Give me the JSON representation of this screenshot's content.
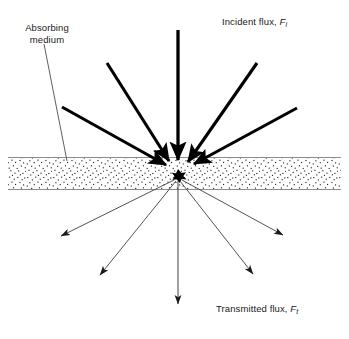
{
  "figure": {
    "background_color": "#ffffff",
    "line_color": "#000000",
    "slab_border_color": "#808080",
    "stipple_color": "#2b2b2b",
    "ray_thin_color": "#555555"
  },
  "labels": {
    "absorbing_medium": "Absorbing\nmedium",
    "incident_flux_text": "Incident flux, ",
    "incident_flux_symbol": "F",
    "incident_flux_subscript": "i",
    "transmitted_flux_text": "Transmitted flux, ",
    "transmitted_flux_symbol": "F",
    "transmitted_flux_subscript": "t"
  },
  "diagram_data": {
    "type": "physics-schematic",
    "scatter_point": {
      "x": 178,
      "y": 176
    },
    "slab": {
      "x": 8,
      "y": 157,
      "width": 333,
      "height": 33
    },
    "incident_rays": [
      {
        "name": "incident-ray-far-left",
        "x1": 62,
        "y1": 107,
        "x2": 170,
        "y2": 167,
        "weight": "thick"
      },
      {
        "name": "incident-ray-left",
        "x1": 107,
        "y1": 63,
        "x2": 172,
        "y2": 163,
        "weight": "thick"
      },
      {
        "name": "incident-ray-vertical",
        "x1": 178,
        "y1": 30,
        "x2": 178,
        "y2": 163,
        "weight": "thick"
      },
      {
        "name": "incident-ray-right",
        "x1": 257,
        "y1": 63,
        "x2": 186,
        "y2": 164,
        "weight": "thick"
      },
      {
        "name": "incident-ray-far-right",
        "x1": 297,
        "y1": 108,
        "x2": 191,
        "y2": 165,
        "weight": "thick"
      }
    ],
    "scattered_rays": [
      {
        "name": "scattered-ray-far-left",
        "x1": 172,
        "y1": 186,
        "x2": 58,
        "y2": 238,
        "weight": "thin"
      },
      {
        "name": "scattered-ray-left",
        "x1": 175,
        "y1": 188,
        "x2": 97,
        "y2": 278,
        "weight": "thin"
      },
      {
        "name": "scattered-ray-transmitted",
        "x1": 178,
        "y1": 188,
        "x2": 178,
        "y2": 312,
        "weight": "thin"
      },
      {
        "name": "scattered-ray-right",
        "x1": 181,
        "y1": 188,
        "x2": 256,
        "y2": 277,
        "weight": "thin"
      },
      {
        "name": "scattered-ray-far-right",
        "x1": 184,
        "y1": 186,
        "x2": 286,
        "y2": 237,
        "weight": "thin"
      }
    ],
    "leader_line": {
      "name": "absorbing-medium-leader",
      "x1": 44,
      "y1": 44,
      "x2": 67,
      "y2": 161
    }
  }
}
